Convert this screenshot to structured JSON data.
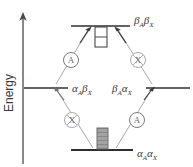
{
  "figure": {
    "type": "energy-level-diagram",
    "background_color": "#ffffff",
    "line_color": "#3a3a3a",
    "faint_color": "#8f8f8f",
    "fill_gray": "#9a9a9a"
  },
  "axis": {
    "label": "Energy",
    "orientation": "vertical",
    "arrow": "up"
  },
  "levels": [
    {
      "id": "top",
      "label_main_1": "β",
      "label_sub_1": "A",
      "label_main_2": "β",
      "label_sub_2": "X",
      "label_text": "βAβX",
      "position": "top-center",
      "population_box": "empty"
    },
    {
      "id": "middle-left",
      "label_main_1": "α",
      "label_sub_1": "A",
      "label_main_2": "β",
      "label_sub_2": "X",
      "label_text": "αAβX",
      "position": "middle-left",
      "population_box": "none"
    },
    {
      "id": "middle-right",
      "label_main_1": "β",
      "label_sub_1": "A",
      "label_main_2": "α",
      "label_sub_2": "X",
      "label_text": "βAαX",
      "position": "middle-right",
      "population_box": "none"
    },
    {
      "id": "bottom",
      "label_main_1": "α",
      "label_sub_1": "A",
      "label_main_2": "α",
      "label_sub_2": "X",
      "label_text": "αAαX",
      "position": "bottom-center",
      "population_box": "filled"
    }
  ],
  "transition_markers": [
    {
      "id": "upper-left",
      "letter": "A",
      "nucleus": "A"
    },
    {
      "id": "upper-right",
      "letter": "X",
      "nucleus": "X"
    },
    {
      "id": "lower-left",
      "letter": "X",
      "nucleus": "X"
    },
    {
      "id": "lower-right",
      "letter": "A",
      "nucleus": "A"
    }
  ],
  "transitions": [
    {
      "from": "middle-left",
      "to": "top",
      "marker": "A",
      "direction": "up"
    },
    {
      "from": "middle-right",
      "to": "top",
      "marker": "X",
      "direction": "up"
    },
    {
      "from": "bottom",
      "to": "middle-left",
      "marker": "X",
      "direction": "up"
    },
    {
      "from": "bottom",
      "to": "middle-right",
      "marker": "A",
      "direction": "up"
    }
  ]
}
